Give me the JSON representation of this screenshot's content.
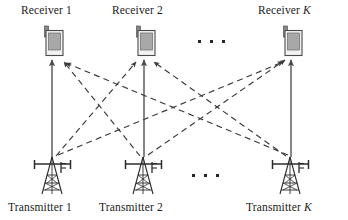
{
  "figure": {
    "type": "interference-channel-diagram",
    "background": "#ffffff",
    "ink_color": "#262626",
    "solid_link_color": "#4a4a4a",
    "dashed_link_color": "#3a3a3a"
  },
  "receivers": [
    {
      "id": "rx1",
      "label_prefix": "Receiver",
      "label_suffix": "1",
      "x": 55,
      "y": 42
    },
    {
      "id": "rx2",
      "label_prefix": "Receiver",
      "label_suffix": "2",
      "x": 145,
      "y": 42
    },
    {
      "id": "rxK",
      "label_prefix": "Receiver",
      "label_suffix": "K",
      "x": 292,
      "y": 42
    }
  ],
  "transmitters": [
    {
      "id": "tx1",
      "label_prefix": "Transmitter",
      "label_suffix": "1",
      "x": 52,
      "y": 172
    },
    {
      "id": "tx2",
      "label_prefix": "Transmitter",
      "label_suffix": "2",
      "x": 143,
      "y": 172
    },
    {
      "id": "txK",
      "label_prefix": "Transmitter",
      "label_suffix": "K",
      "x": 290,
      "y": 172
    }
  ],
  "labels": {
    "receiver_1": "Receiver 1",
    "receiver_2": "Receiver 2",
    "receiver_K_text": "Receiver ",
    "receiver_K_var": "K",
    "transmitter_1": "Transmitter 1",
    "transmitter_2": "Transmitter 2",
    "transmitter_K_text": "Transmitter ",
    "transmitter_K_var": "K"
  },
  "ellipses": {
    "receiver_row": {
      "dots": 3,
      "x": 198,
      "y": 40
    },
    "transmitter_row": {
      "dots": 3,
      "x": 192,
      "y": 174
    }
  },
  "links": {
    "direct_solid": [
      {
        "from": "tx1",
        "to": "rx1",
        "style": "solid",
        "arrow": true
      },
      {
        "from": "tx2",
        "to": "rx2",
        "style": "solid",
        "arrow": true
      },
      {
        "from": "txK",
        "to": "rxK",
        "style": "solid",
        "arrow": true
      }
    ],
    "interference_dashed": [
      {
        "from": "tx1",
        "to": "rx2",
        "style": "dashed",
        "arrow": true
      },
      {
        "from": "tx1",
        "to": "rxK",
        "style": "dashed",
        "arrow": true
      },
      {
        "from": "tx2",
        "to": "rx1",
        "style": "dashed",
        "arrow": true
      },
      {
        "from": "tx2",
        "to": "rxK",
        "style": "dashed",
        "arrow": true
      },
      {
        "from": "txK",
        "to": "rx1",
        "style": "dashed",
        "arrow": true
      },
      {
        "from": "txK",
        "to": "rx2",
        "style": "dashed",
        "arrow": true
      }
    ]
  }
}
